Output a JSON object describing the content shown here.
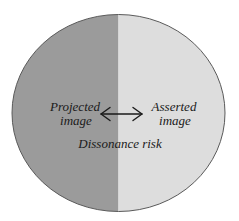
{
  "diagram": {
    "shape": "ellipse",
    "left_region": {
      "label_line1": "Projected",
      "label_line2": "image",
      "fill": "#9b9b9b"
    },
    "right_region": {
      "label_line1": "Asserted",
      "label_line2": "image",
      "fill": "#dddddd"
    },
    "connector": {
      "type": "double-headed-arrow",
      "color": "#1a1a1a"
    },
    "caption": "Dissonance risk",
    "outline_color": "#5a5a5a",
    "background": "#ffffff"
  }
}
